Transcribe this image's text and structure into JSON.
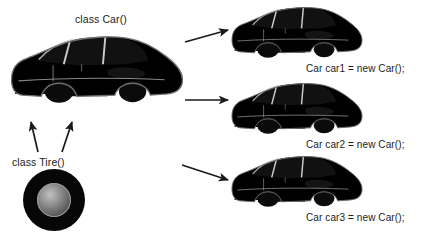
{
  "diagram": {
    "title_text": "class Car() instantiation diagram",
    "background_color": "#ffffff",
    "text_color": "#1b1b1b",
    "class_car_label": "class Car()",
    "class_tire_label": "class Tire()",
    "instances": [
      {
        "label": "Car car1 = new Car();",
        "body_color": "#e8e8e8"
      },
      {
        "label": "Car car2 = new Car();",
        "body_color": "#8f8f8f"
      },
      {
        "label": "Car car3 = new Car();",
        "body_color": "#ededed"
      }
    ],
    "class_car": {
      "body_color": "#e4e4e4",
      "window_color": "#111111",
      "wheel_color": "#0d0d0d"
    },
    "class_tire": {
      "tire_color": "#0a0a0a",
      "hub_color_light": "#b9b9b9",
      "hub_color_dark": "#5a5a5a"
    },
    "arrows": {
      "composition_left": "tire-to-car-arrow-left",
      "composition_right": "tire-to-car-arrow-right",
      "instantiation_1": "car-to-instance-1-arrow",
      "instantiation_2": "car-to-instance-2-arrow",
      "instantiation_3": "car-to-instance-3-arrow"
    }
  }
}
